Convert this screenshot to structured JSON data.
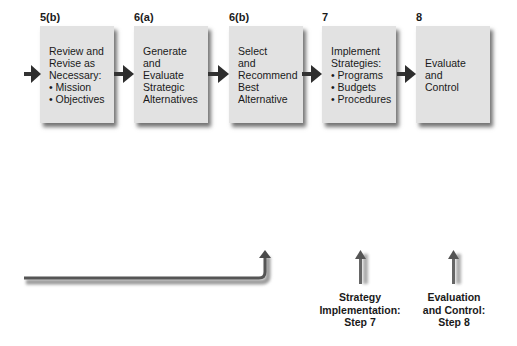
{
  "steps": [
    {
      "number": "5(b)",
      "lines": [
        "Review and",
        "Revise as",
        "Necessary:",
        "• Mission",
        "• Objectives"
      ]
    },
    {
      "number": "6(a)",
      "lines": [
        "Generate",
        "and",
        "Evaluate",
        "Strategic",
        "Alternatives"
      ]
    },
    {
      "number": "6(b)",
      "lines": [
        "Select",
        "and",
        "Recommend",
        "Best",
        "Alternative"
      ]
    },
    {
      "number": "7",
      "lines": [
        "Implement",
        "Strategies:",
        "• Programs",
        "• Budgets",
        "• Procedures"
      ]
    },
    {
      "number": "8",
      "lines": [
        "Evaluate",
        "and",
        "Control"
      ]
    }
  ],
  "captions": {
    "implementation": [
      "Strategy",
      "Implementation:",
      "Step 7"
    ],
    "evaluation": [
      "Evaluation",
      "and Control:",
      "Step 8"
    ]
  },
  "colors": {
    "box_fill": "#e2e2e2",
    "arrow": "#4a4a4a",
    "text": "#1a1a1a"
  }
}
